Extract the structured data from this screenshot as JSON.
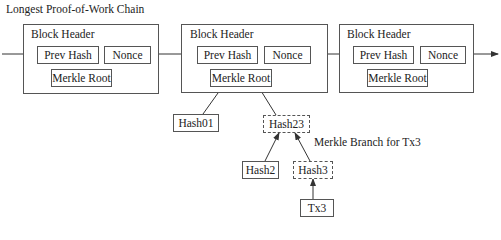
{
  "title": "Longest Proof-of-Work Chain",
  "blocks": [
    {
      "header_label": "Block Header",
      "prev_hash": "Prev Hash",
      "nonce": "Nonce",
      "merkle_root": "Merkle Root"
    },
    {
      "header_label": "Block Header",
      "prev_hash": "Prev Hash",
      "nonce": "Nonce",
      "merkle_root": "Merkle Root"
    },
    {
      "header_label": "Block Header",
      "prev_hash": "Prev Hash",
      "nonce": "Nonce",
      "merkle_root": "Merkle Root"
    }
  ],
  "merkle_tree": {
    "hash01": "Hash01",
    "hash23": "Hash23",
    "hash2": "Hash2",
    "hash3": "Hash3",
    "tx3": "Tx3"
  },
  "annotation": "Merkle Branch for Tx3",
  "colors": {
    "stroke": "#555555",
    "text": "#222222",
    "background": "#ffffff"
  }
}
